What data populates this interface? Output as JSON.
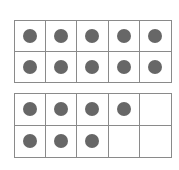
{
  "colors": {
    "dot": "#676767",
    "grid": "#8a8a8a",
    "background": "#ffffff"
  },
  "frames": [
    {
      "name": "ten-frame-1",
      "filled": [
        1,
        1,
        1,
        1,
        1,
        1,
        1,
        1,
        1,
        1
      ],
      "count": 10
    },
    {
      "name": "ten-frame-2",
      "filled": [
        1,
        1,
        1,
        1,
        0,
        1,
        1,
        1,
        0,
        0
      ],
      "count": 7
    }
  ],
  "total": 17
}
